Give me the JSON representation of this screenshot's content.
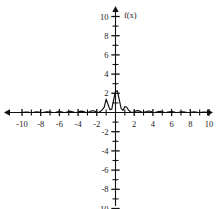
{
  "chart_data": {
    "type": "line",
    "title": "",
    "subtitle": "",
    "xlabel": "",
    "ylabel": "f(x)",
    "xlim": [
      -10.8,
      10.8
    ],
    "ylim": [
      -10.4,
      10.6
    ],
    "grid": false,
    "legend": null,
    "legend_position": "none",
    "axis_style": "cartesian-arrows",
    "x_tick_labels": [
      "-10",
      "-8",
      "-6",
      "-4",
      "-2",
      "2",
      "4",
      "6",
      "8",
      "10"
    ],
    "x_tick_values": [
      -10,
      -8,
      -6,
      -4,
      -2,
      2,
      4,
      6,
      8,
      10
    ],
    "x_minor_ticks": [
      -9,
      -7,
      -5,
      -3,
      -1,
      1,
      3,
      5,
      7,
      9
    ],
    "y_tick_labels": [
      "10",
      "8",
      "6",
      "4",
      "2",
      "-2",
      "-4",
      "-6",
      "-8",
      "-10"
    ],
    "y_tick_values": [
      10,
      8,
      6,
      4,
      2,
      -2,
      -4,
      -6,
      -8,
      -10
    ],
    "y_minor_ticks": [
      9,
      7,
      5,
      3,
      1,
      -1,
      -3,
      -5,
      -7,
      -9
    ],
    "series": [
      {
        "name": "f(x)",
        "color": "#0d0d0d",
        "description": "damped oscillating wave packet centered near the origin",
        "x": [
          -10.0,
          -9.8,
          -9.6,
          -9.4,
          -9.2,
          -9.0,
          -8.8,
          -8.6,
          -8.4,
          -8.2,
          -8.0,
          -7.8,
          -7.6,
          -7.4,
          -7.2,
          -7.0,
          -6.8,
          -6.6,
          -6.4,
          -6.2,
          -6.0,
          -5.8,
          -5.6,
          -5.4,
          -5.2,
          -5.0,
          -4.8,
          -4.6,
          -4.4,
          -4.2,
          -4.0,
          -3.8,
          -3.6,
          -3.4,
          -3.2,
          -3.0,
          -2.8,
          -2.6,
          -2.4,
          -2.2,
          -2.0,
          -1.8,
          -1.6,
          -1.4,
          -1.2,
          -1.0,
          -0.8,
          -0.6,
          -0.4,
          -0.2,
          0.0,
          0.2,
          0.4,
          0.6,
          0.8,
          1.0,
          1.2,
          1.4,
          1.6,
          1.8,
          2.0,
          2.2,
          2.4,
          2.6,
          2.8,
          3.0,
          3.2,
          3.4,
          3.6,
          3.8,
          4.0,
          4.2,
          4.4,
          4.6,
          4.8,
          5.0,
          5.2,
          5.4,
          5.6,
          5.8,
          6.0,
          6.2,
          6.4,
          6.6,
          6.8,
          7.0,
          7.2,
          7.4,
          7.6,
          7.8,
          8.0,
          8.2,
          8.4,
          8.6,
          8.8,
          9.0,
          9.2,
          9.4,
          9.6,
          9.8,
          10.0
        ],
        "y": [
          0.01,
          0.03,
          0.05,
          0.04,
          0.01,
          0.0,
          0.02,
          0.05,
          0.06,
          0.04,
          0.01,
          0.0,
          0.03,
          0.06,
          0.07,
          0.05,
          0.01,
          0.0,
          0.03,
          0.07,
          0.09,
          0.06,
          0.02,
          0.0,
          0.04,
          0.09,
          0.11,
          0.08,
          0.02,
          0.0,
          0.05,
          0.12,
          0.14,
          0.1,
          0.03,
          0.0,
          0.07,
          0.16,
          0.19,
          0.13,
          0.04,
          0.0,
          0.12,
          0.3,
          0.55,
          1.4,
          0.85,
          0.3,
          0.35,
          1.3,
          2.2,
          2.25,
          1.35,
          0.42,
          0.22,
          0.62,
          0.55,
          0.24,
          0.05,
          0.0,
          0.06,
          0.17,
          0.2,
          0.14,
          0.04,
          0.0,
          0.06,
          0.13,
          0.15,
          0.1,
          0.03,
          0.0,
          0.05,
          0.1,
          0.12,
          0.08,
          0.02,
          0.0,
          0.04,
          0.08,
          0.09,
          0.06,
          0.02,
          0.0,
          0.03,
          0.06,
          0.07,
          0.05,
          0.01,
          0.0,
          0.02,
          0.05,
          0.06,
          0.04,
          0.01,
          0.0,
          0.02,
          0.04,
          0.05,
          0.03,
          0.01
        ]
      }
    ],
    "annotations": [
      {
        "text": "f(x)",
        "x": 0.9,
        "y": 10.2,
        "role": "y-axis-name"
      }
    ]
  }
}
